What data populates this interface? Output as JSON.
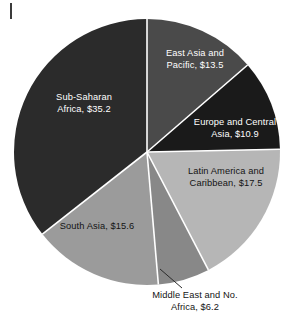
{
  "chart_data": {
    "type": "pie",
    "title": "",
    "subtitle": "",
    "xlabel": "",
    "ylabel": "",
    "legend_position": "none",
    "grid": false,
    "value_prefix": "$",
    "total": 98.9,
    "start_angle_deg": 0,
    "direction": "clockwise",
    "categories": [
      "East Asia and Pacific",
      "Europe and Central Asia",
      "Latin America and Caribbean",
      "Middle East and No. Africa",
      "South Asia",
      "Sub-Saharan Africa"
    ],
    "values": [
      13.5,
      10.9,
      17.5,
      6.2,
      15.6,
      35.2
    ],
    "slices": [
      {
        "name": "east-asia-pacific",
        "label_line1": "East Asia and",
        "label_line2": "Pacific, $13.5",
        "value": 13.5,
        "color": "#4a4a4a",
        "text_color": "#ffffff",
        "start_deg": 0,
        "end_deg": 49.14
      },
      {
        "name": "europe-central-asia",
        "label_line1": "Europe and Central",
        "label_line2": "Asia, $10.9",
        "value": 10.9,
        "color": "#1a1a1a",
        "text_color": "#ffffff",
        "start_deg": 49.14,
        "end_deg": 88.81
      },
      {
        "name": "latin-america-caribbean",
        "label_line1": "Latin America and",
        "label_line2": "Caribbean, $17.5",
        "value": 17.5,
        "color": "#b6b6b6",
        "text_color": "#141414",
        "start_deg": 88.81,
        "end_deg": 152.52
      },
      {
        "name": "middle-east-no-africa",
        "label_line1": "Middle East and No.",
        "label_line2": "Africa, $6.2",
        "value": 6.2,
        "color": "#888888",
        "text_color": "#141414",
        "start_deg": 152.52,
        "end_deg": 175.09
      },
      {
        "name": "south-asia",
        "label_line1": "South Asia, $15.6",
        "label_line2": "",
        "value": 15.6,
        "color": "#9b9b9b",
        "text_color": "#141414",
        "start_deg": 175.09,
        "end_deg": 231.87
      },
      {
        "name": "sub-saharan-africa",
        "label_line1": "Sub-Saharan",
        "label_line2": "Africa, $35.2",
        "value": 35.2,
        "color": "#2b2b2b",
        "text_color": "#ffffff",
        "start_deg": 231.87,
        "end_deg": 360
      }
    ],
    "geometry": {
      "center_x": 147,
      "center_y": 152,
      "radius": 133,
      "separator_color": "#ffffff",
      "separator_width": 1.6
    },
    "leader_line": {
      "name": "middle-east-leader-line",
      "x1": 160,
      "y1": 269,
      "x2": 182,
      "y2": 288,
      "color": "#2b2b2b"
    }
  }
}
